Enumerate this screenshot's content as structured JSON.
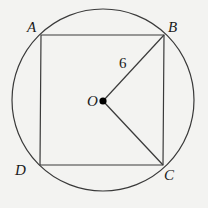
{
  "diagram": {
    "labels": {
      "A": "A",
      "B": "B",
      "C": "C",
      "D": "D",
      "O": "O",
      "radius": "6"
    },
    "colors": {
      "background": "#f3f3f1",
      "stroke": "#3a3a3a",
      "center_dot": "#000000"
    },
    "geometry": {
      "circle": {
        "cx": 103,
        "cy": 100,
        "r": 91
      },
      "square": {
        "A": [
          41,
          35
        ],
        "B": [
          164,
          35
        ],
        "C": [
          163,
          165
        ],
        "D": [
          40,
          165
        ]
      },
      "center": [
        103,
        101
      ],
      "segments": [
        "OB",
        "OC"
      ]
    }
  }
}
